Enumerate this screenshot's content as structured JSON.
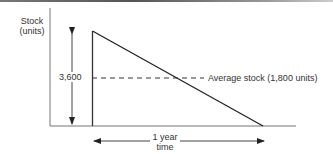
{
  "diagram": {
    "type": "inventory-sawtooth",
    "y_axis_label_line1": "Stock",
    "y_axis_label_line2": "(units)",
    "max_stock_label": "3,600",
    "average_label": "Average stock (1,800 units)",
    "period_label_line1": "1 year",
    "period_label_line2": "time",
    "max_stock": 3600,
    "average_stock": 1800,
    "period": "1 year"
  }
}
